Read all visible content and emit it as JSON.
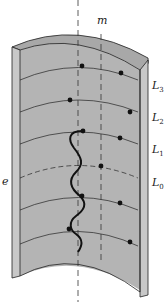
{
  "diagram": {
    "labels": {
      "m": "m",
      "e": "e",
      "levels": [
        {
          "name": "L",
          "sub": "3"
        },
        {
          "name": "L",
          "sub": "2"
        },
        {
          "name": "L",
          "sub": "1"
        },
        {
          "name": "L",
          "sub": "0"
        }
      ]
    },
    "colors": {
      "shell_fill": "#b4b4b4",
      "wall_edge_fill": "#c8c8c8",
      "line": "#222222",
      "dot": "#111111",
      "background": "#ffffff"
    }
  }
}
